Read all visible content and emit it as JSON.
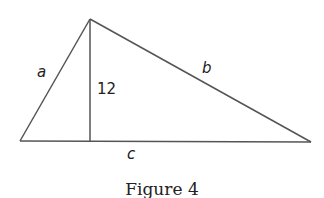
{
  "figure": {
    "caption": "Figure 4",
    "stroke_color": "#555555",
    "labels": {
      "side_a": "a",
      "side_b": "b",
      "side_c": "c",
      "altitude": "12"
    }
  }
}
